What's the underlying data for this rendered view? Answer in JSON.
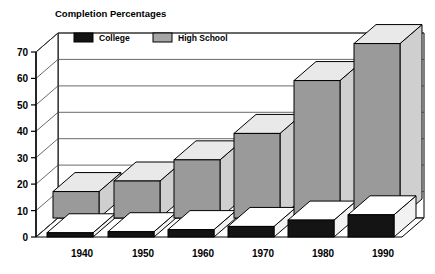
{
  "chart_data": {
    "type": "bar",
    "title": "Completion Percentages",
    "xlabel": "",
    "ylabel": "",
    "ylim": [
      0,
      70
    ],
    "yticks": [
      0,
      10,
      20,
      30,
      40,
      50,
      60,
      70
    ],
    "grid": true,
    "legend_position": "top-left-inside",
    "style": "3d-isometric-bars",
    "categories": [
      "1940",
      "1950",
      "1960",
      "1970",
      "1980",
      "1990"
    ],
    "series": [
      {
        "name": "College",
        "color": "#1a1a1a",
        "values": [
          4,
          5,
          7,
          10,
          16,
          21
        ]
      },
      {
        "name": "High School",
        "color": "#9a9a9a",
        "values": [
          10,
          14,
          22,
          32,
          52,
          66
        ]
      }
    ]
  },
  "legend": {
    "items": [
      {
        "label": "College",
        "swatch": "#1a1a1a"
      },
      {
        "label": "High School",
        "swatch": "#9a9a9a"
      }
    ]
  },
  "axis": {
    "y_tick_labels": [
      "70",
      "60",
      "50",
      "40",
      "30",
      "20",
      "10",
      "0"
    ],
    "x_tick_labels": [
      "1940",
      "1950",
      "1960",
      "1970",
      "1980",
      "1990"
    ]
  },
  "colors": {
    "background": "#ffffff",
    "outline": "#000000",
    "grid": "#555555",
    "college_front": "#141414",
    "college_top": "#ffffff",
    "college_side": "#ffffff",
    "highschool_front": "#9a9a9a",
    "highschool_top": "#e8e8e8",
    "highschool_side": "#d0d0d0",
    "floor": "#ffffff",
    "wall": "#ffffff"
  }
}
